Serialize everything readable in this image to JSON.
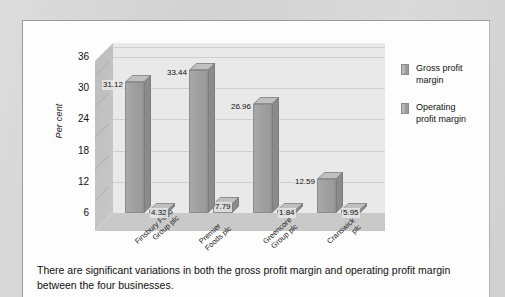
{
  "chart_data": {
    "type": "bar",
    "title": "",
    "xlabel": "",
    "ylabel": "Per cent",
    "ylim": [
      6,
      36
    ],
    "yticks": [
      6,
      12,
      18,
      24,
      30,
      36
    ],
    "grid": true,
    "legend_position": "right",
    "three_d": true,
    "categories": [
      "Finsbury Food Group plc",
      "Premier Foods plc",
      "Greencore Group plc",
      "Cranswick plc"
    ],
    "category_lines": [
      [
        "Finsbury Food",
        "Group plc"
      ],
      [
        "Premier",
        "Foods plc"
      ],
      [
        "Greencore",
        "Group plc"
      ],
      [
        "Cranswick",
        "plc"
      ]
    ],
    "series": [
      {
        "name": "Gross profit margin",
        "color": "#9f9f9f",
        "values": [
          31.12,
          33.44,
          26.96,
          12.59
        ],
        "labels": [
          "31.12",
          "33.44",
          "26.96",
          "12.59"
        ]
      },
      {
        "name": "Operating profit margin",
        "color": "#9f9f9f",
        "values": [
          4.32,
          7.79,
          1.84,
          5.95
        ],
        "labels": [
          "4.32",
          "7.79",
          "1.84",
          "5.95"
        ]
      }
    ]
  },
  "legend": {
    "items": [
      {
        "label_line1": "Gross profit",
        "label_line2": "margin"
      },
      {
        "label_line1": "Operating",
        "label_line2": "profit margin"
      }
    ]
  },
  "caption": {
    "line1": "There are significant variations in both the gross profit margin and operating profit margin",
    "line2": "between the four businesses."
  },
  "colors": {
    "page_background": "#d9d9d9",
    "card_background": "#fdfdfd",
    "plot_background": "#e9e9e9",
    "bar_front": "#9f9f9f",
    "bar_top": "#c0c0c0",
    "bar_side": "#8b8b8b",
    "gridline": "#cfcfcf",
    "text": "#111111"
  }
}
